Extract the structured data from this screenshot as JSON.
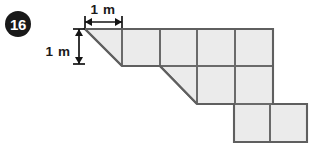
{
  "badge": {
    "label": "16",
    "shape": "circle",
    "background_color": "#191919",
    "text_color": "#ffffff",
    "center_x": 18,
    "center_y": 24,
    "radius": 13
  },
  "dimensions": {
    "horizontal": {
      "label": "1 m",
      "orientation": "horizontal",
      "x_start": 85,
      "x_end": 122,
      "y": 22,
      "label_x": 103,
      "label_y": 14,
      "tick_top": 16,
      "tick_bottom": 28
    },
    "vertical": {
      "label": "1 m",
      "orientation": "vertical",
      "x": 79,
      "y_start": 29,
      "y_end": 64,
      "label_x": 58,
      "label_y": 51,
      "tick_left": 73,
      "tick_right": 85
    }
  },
  "figure": {
    "name": "composite-staircase-polygon",
    "fill_color": "#ebebeb",
    "outline_color": "#5f5f5f",
    "grid_color": "#6a6a6a",
    "unit_label": "1 m",
    "origin_x": 85,
    "origin_y": 29,
    "cell_width": 37.6,
    "cell_height": 37.6,
    "outline_path": "M 85 29 L 273 29 L 273 104 L 307 104 L 307 142 L 234 142 L 234 104 L 197 104 L 160 66 L 122 66 Z",
    "interior_segments": [
      "M 122 29 L 122 66",
      "M 160 29 L 160 66",
      "M 197 29 L 197 104",
      "M 235 29 L 235 104",
      "M 122 66 L 273 66",
      "M 197 104 L 273 104",
      "M 270 104 L 270 142",
      "M 85 29 L 122 66",
      "M 160 66 L 197 104"
    ],
    "rows": [
      {
        "name": "top-row",
        "y_top": 29,
        "y_bottom": 66,
        "triangle": {
          "apex_x": 85,
          "apex_y": 29,
          "right_x": 122,
          "bottom_y": 66
        },
        "square_count": 4,
        "squares_x_start": 122,
        "squares_x_end": 273
      },
      {
        "name": "middle-row",
        "y_top": 66,
        "y_bottom": 104,
        "triangle": {
          "apex_x": 160,
          "apex_y": 66,
          "right_x": 197,
          "bottom_y": 104
        },
        "square_count": 2,
        "squares_x_start": 197,
        "squares_x_end": 273
      },
      {
        "name": "bottom-row",
        "y_top": 104,
        "y_bottom": 142,
        "triangle": null,
        "square_count": 2,
        "squares_x_start": 234,
        "squares_x_end": 307
      }
    ]
  }
}
